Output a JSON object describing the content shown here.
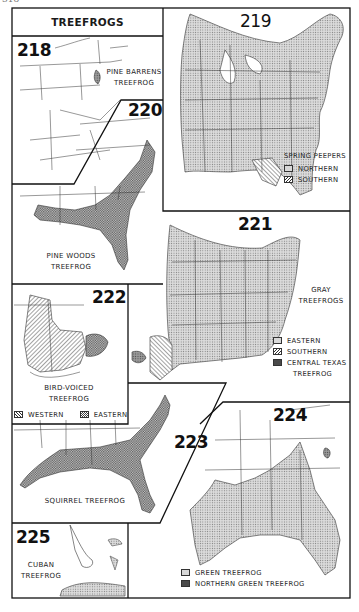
{
  "page": {
    "number": "318"
  },
  "title": "TREEFROGS",
  "maps": [
    {
      "id": "218",
      "label_lines": [
        "PINE BARRENS",
        "TREEFROG"
      ],
      "legend": []
    },
    {
      "id": "219",
      "label_lines": [
        "SPRING PEEPERS"
      ],
      "legend": [
        {
          "pattern": "dots",
          "label": "NORTHERN"
        },
        {
          "pattern": "hatch",
          "label": "SOUTHERN"
        }
      ]
    },
    {
      "id": "220",
      "label_lines": [
        "PINE WOODS",
        "TREEFROG"
      ],
      "legend": []
    },
    {
      "id": "221",
      "label_lines": [
        "GRAY",
        "TREEFROGS"
      ],
      "legend": [
        {
          "pattern": "dots",
          "label": "EASTERN"
        },
        {
          "pattern": "hatch",
          "label": "SOUTHERN"
        },
        {
          "pattern": "dark",
          "label": "CENTRAL TEXAS"
        },
        {
          "pattern": "none",
          "label": "TREEFROG"
        }
      ]
    },
    {
      "id": "222",
      "label_lines": [
        "BIRD-VOICED",
        "TREEFROG"
      ],
      "legend": [
        {
          "pattern": "hatch-w",
          "label": "WESTERN"
        },
        {
          "pattern": "check",
          "label": "EASTERN"
        }
      ]
    },
    {
      "id": "223",
      "label_lines": [
        "SQUIRREL TREEFROG"
      ],
      "legend": []
    },
    {
      "id": "224",
      "label_lines": [],
      "legend": [
        {
          "pattern": "dots",
          "label": "GREEN TREEFROG"
        },
        {
          "pattern": "dark",
          "label": "NORTHERN GREEN TREEFROG"
        }
      ]
    },
    {
      "id": "225",
      "label_lines": [
        "CUBAN",
        "TREEFROG"
      ],
      "legend": []
    }
  ],
  "colors": {
    "ink": "#1a1a1a",
    "range_fill": "#d6d6d6",
    "dark_fill": "#8f8f8f",
    "paper": "#ffffff"
  }
}
